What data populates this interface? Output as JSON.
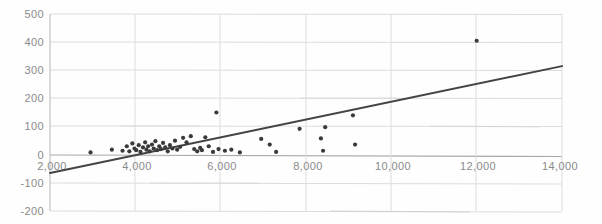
{
  "chart_data": {
    "type": "scatter",
    "title": "",
    "subtitle": "",
    "xlabel": "",
    "ylabel": "",
    "xlim": [
      2000,
      14000
    ],
    "ylim": [
      -200,
      500
    ],
    "grid": true,
    "legend": null,
    "x_ticks": [
      2000,
      4000,
      6000,
      8000,
      10000,
      12000,
      14000
    ],
    "x_tick_labels": [
      "2,000",
      "4,000",
      "6,000",
      "8,000",
      "10,000",
      "12,000",
      "14,000"
    ],
    "y_ticks": [
      -200,
      -100,
      0,
      100,
      200,
      300,
      400,
      500
    ],
    "y_tick_labels": [
      "-200",
      "-100",
      "0",
      "100",
      "200",
      "300",
      "400",
      "500"
    ],
    "series": [
      {
        "name": "observations",
        "type": "scatter",
        "marker": "circle",
        "color": "#3a3a3a",
        "points": [
          [
            2950,
            8
          ],
          [
            3450,
            18
          ],
          [
            3700,
            14
          ],
          [
            3800,
            30
          ],
          [
            3860,
            12
          ],
          [
            3930,
            40
          ],
          [
            3980,
            22
          ],
          [
            4020,
            16
          ],
          [
            4080,
            34
          ],
          [
            4120,
            10
          ],
          [
            4180,
            26
          ],
          [
            4230,
            44
          ],
          [
            4260,
            18
          ],
          [
            4300,
            30
          ],
          [
            4340,
            12
          ],
          [
            4390,
            36
          ],
          [
            4430,
            22
          ],
          [
            4470,
            48
          ],
          [
            4510,
            16
          ],
          [
            4560,
            30
          ],
          [
            4600,
            20
          ],
          [
            4650,
            42
          ],
          [
            4700,
            26
          ],
          [
            4760,
            12
          ],
          [
            4810,
            34
          ],
          [
            4870,
            22
          ],
          [
            4930,
            50
          ],
          [
            4980,
            18
          ],
          [
            5050,
            28
          ],
          [
            5120,
            60
          ],
          [
            5200,
            44
          ],
          [
            5300,
            66
          ],
          [
            5380,
            20
          ],
          [
            5450,
            12
          ],
          [
            5520,
            24
          ],
          [
            5560,
            16
          ],
          [
            5640,
            62
          ],
          [
            5720,
            30
          ],
          [
            5820,
            10
          ],
          [
            5900,
            150
          ],
          [
            5950,
            20
          ],
          [
            6100,
            14
          ],
          [
            6250,
            18
          ],
          [
            6450,
            8
          ],
          [
            6950,
            56
          ],
          [
            7150,
            36
          ],
          [
            7300,
            10
          ],
          [
            7850,
            92
          ],
          [
            8350,
            58
          ],
          [
            8400,
            14
          ],
          [
            8450,
            98
          ],
          [
            9100,
            140
          ],
          [
            9150,
            36
          ],
          [
            12000,
            405
          ]
        ]
      },
      {
        "name": "fitted-regression-line",
        "type": "line",
        "color": "#444444",
        "endpoints": [
          [
            2000,
            -65
          ],
          [
            14000,
            315
          ]
        ]
      }
    ]
  },
  "axes": {
    "x_axis_name": "x-axis",
    "y_axis_name": "y-axis"
  }
}
